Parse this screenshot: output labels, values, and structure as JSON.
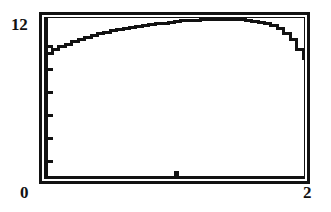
{
  "figure": {
    "kind": "calculator-plot",
    "background_color": "#ffffff",
    "ink_color": "#121212"
  },
  "labels": {
    "y_max": "12",
    "x_min": "0",
    "x_max": "2"
  },
  "chart_data": {
    "type": "line",
    "title": "",
    "xlabel": "",
    "ylabel": "",
    "xlim": [
      0,
      2
    ],
    "ylim": [
      0,
      12
    ],
    "xticks": [
      0,
      1,
      2
    ],
    "xtick_labels": [
      "0",
      "",
      "2"
    ],
    "yticks": [
      0,
      2,
      4,
      6,
      8,
      10,
      12
    ],
    "ytick_labels": [
      "",
      "",
      "",
      "",
      "",
      "",
      "12"
    ],
    "grid": false,
    "legend": false,
    "frame": "box",
    "series": [
      {
        "name": "curve",
        "x": [
          0.0,
          0.05,
          0.1,
          0.15,
          0.2,
          0.25,
          0.3,
          0.35,
          0.4,
          0.45,
          0.5,
          0.55,
          0.6,
          0.65,
          0.7,
          0.75,
          0.8,
          0.85,
          0.9,
          0.95,
          1.0,
          1.05,
          1.1,
          1.15,
          1.2,
          1.25,
          1.3,
          1.35,
          1.4,
          1.45,
          1.5,
          1.55,
          1.6,
          1.65,
          1.7,
          1.75,
          1.8,
          1.85,
          1.9,
          1.95,
          2.0
        ],
        "y": [
          9.3,
          9.55,
          9.78,
          9.98,
          10.17,
          10.34,
          10.5,
          10.64,
          10.77,
          10.89,
          11.0,
          11.1,
          11.19,
          11.27,
          11.34,
          11.41,
          11.47,
          11.52,
          11.57,
          11.61,
          11.72,
          11.76,
          11.79,
          11.81,
          11.82,
          11.82,
          11.82,
          11.82,
          11.82,
          11.82,
          11.82,
          11.8,
          11.72,
          11.64,
          11.52,
          11.36,
          11.14,
          10.82,
          10.35,
          9.6,
          8.85
        ]
      }
    ]
  }
}
